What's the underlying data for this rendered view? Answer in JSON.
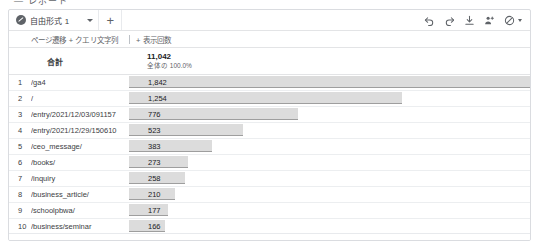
{
  "top_fragment": "— レポート",
  "tabbar": {
    "tab_label": "自由形式 1",
    "tab_icon": "freeform-tab-icon",
    "caret_icon": "chevron-down-icon",
    "add_label": "+",
    "tools": [
      {
        "name": "undo-icon",
        "label": "元に戻す"
      },
      {
        "name": "redo-icon",
        "label": "やり直す"
      },
      {
        "name": "download-icon",
        "label": "ダウンロード"
      },
      {
        "name": "share-person-icon",
        "label": "共有"
      },
      {
        "name": "no-access-icon",
        "label": "アクセス権なし"
      }
    ]
  },
  "table": {
    "dimension_header": "ページ遷移 + クエリ文字列",
    "metric_header": "+ 表示回数",
    "total_label": "合計",
    "total_value": "11,042",
    "total_sub": "全体の 100.0%"
  },
  "chart_data": {
    "type": "bar",
    "title": "表示回数",
    "xlabel": "表示回数",
    "ylabel": "ページ遷移 + クエリ文字列",
    "grid": false,
    "legend": "none",
    "xlim": [
      0,
      1842
    ],
    "categories": [
      "/ga4",
      "/",
      "/entry/2021/12/03/091157",
      "/entry/2021/12/29/150610",
      "/ceo_message/",
      "/books/",
      "/inquiry",
      "/business_article/",
      "/schoolpbwa/",
      "/business/seminar"
    ],
    "values": [
      1842,
      1254,
      776,
      523,
      383,
      273,
      258,
      210,
      177,
      166
    ],
    "value_labels": [
      "1,842",
      "1,254",
      "776",
      "523",
      "383",
      "273",
      "258",
      "210",
      "177",
      "166"
    ],
    "ranks": [
      "1",
      "2",
      "3",
      "4",
      "5",
      "6",
      "7",
      "8",
      "9",
      "10"
    ],
    "total": 11042
  }
}
